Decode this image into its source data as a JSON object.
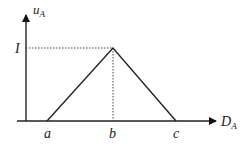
{
  "diagram": {
    "type": "triangular-membership-function",
    "y_axis": {
      "label": "u",
      "subscript": "A"
    },
    "x_axis": {
      "label": "D",
      "subscript": "A"
    },
    "peak_label": "I",
    "x_points": [
      "a",
      "b",
      "c"
    ],
    "colors": {
      "line": "#222222",
      "background": "#ffffff"
    }
  }
}
